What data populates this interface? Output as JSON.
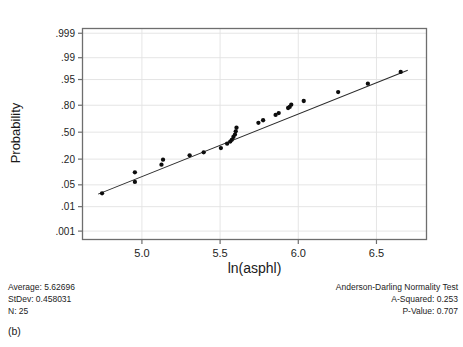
{
  "figure": {
    "title": "",
    "caption": "(b)"
  },
  "axes": {
    "ylabel": "Probability",
    "xlabel": "ln(asphl)",
    "y_ticks": [
      ".999",
      ".99",
      ".95",
      ".80",
      ".50",
      ".20",
      ".05",
      ".01",
      ".001"
    ],
    "y_tick_values": [
      0.999,
      0.99,
      0.95,
      0.8,
      0.5,
      0.2,
      0.05,
      0.01,
      0.001
    ],
    "x_ticks": [
      "5.0",
      "5.5",
      "6.0",
      "6.5"
    ],
    "x_tick_values": [
      5.0,
      5.5,
      6.0,
      6.5
    ],
    "grid": true
  },
  "stats": {
    "average_label": "Average: 5.62696",
    "stdev_label": "StDev: 0.458031",
    "n_label": "N: 25",
    "test_title": "Anderson-Darling Normality Test",
    "a_squared_label": "A-Squared: 0.253",
    "p_value_label": "P-Value:   0.707",
    "average": 5.62696,
    "stdev": 0.458031,
    "n": 25,
    "a_squared": 0.253,
    "p_value": 0.707
  },
  "colors": {
    "frame": "#6e6e6e",
    "grid": "#e2e2e2",
    "marker": "#0d0d0d",
    "fitline": "#2a2a2a",
    "text": "#1a1a1a",
    "background": "#ffffff"
  },
  "chart_data": {
    "type": "scatter",
    "title": "",
    "subtitle": "",
    "xlabel": "ln(asphl)",
    "ylabel": "Probability",
    "xlim": [
      4.62,
      6.82
    ],
    "ylim": [
      0.0004,
      0.9994
    ],
    "y_scale": "normal-probability",
    "grid": true,
    "legend": null,
    "x_ticks": [
      5.0,
      5.5,
      6.0,
      6.5
    ],
    "y_ticks": [
      0.001,
      0.01,
      0.05,
      0.2,
      0.5,
      0.8,
      0.95,
      0.99,
      0.999
    ],
    "series": [
      {
        "name": "ln(asphl) order statistics",
        "marker": "filled-circle",
        "x": [
          4.745,
          4.955,
          4.955,
          5.125,
          5.135,
          5.305,
          5.395,
          5.505,
          5.545,
          5.565,
          5.575,
          5.585,
          5.595,
          5.6,
          5.605,
          5.745,
          5.775,
          5.855,
          5.875,
          5.935,
          5.945,
          5.955,
          6.035,
          6.255,
          6.445,
          6.655
        ],
        "y": [
          0.028,
          0.06,
          0.105,
          0.155,
          0.195,
          0.235,
          0.265,
          0.31,
          0.36,
          0.385,
          0.405,
          0.44,
          0.47,
          0.51,
          0.555,
          0.615,
          0.645,
          0.705,
          0.725,
          0.775,
          0.785,
          0.805,
          0.835,
          0.895,
          0.935,
          0.97
        ]
      },
      {
        "name": "fitted normal reference line",
        "type": "line",
        "x": [
          4.72,
          6.7
        ],
        "y": [
          0.0265,
          0.9735
        ]
      }
    ],
    "annotations": [
      "Average: 5.62696",
      "StDev: 0.458031",
      "N: 25",
      "Anderson-Darling Normality Test",
      "A-Squared: 0.253",
      "P-Value:   0.707"
    ]
  }
}
